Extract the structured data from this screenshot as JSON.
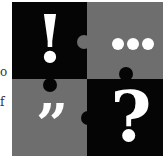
{
  "edge_text": {
    "line1": "o",
    "line2": "f"
  },
  "puzzle": {
    "colors": {
      "dark": "#050505",
      "gray": "#6e6e6e",
      "glyph": "#ffffff"
    },
    "pieces": [
      {
        "position": "top-left",
        "color": "dark",
        "symbol": "!",
        "name": "exclamation"
      },
      {
        "position": "top-right",
        "color": "gray",
        "symbol": "•••",
        "name": "ellipsis"
      },
      {
        "position": "bottom-left",
        "color": "gray",
        "symbol": "”",
        "name": "quotation"
      },
      {
        "position": "bottom-right",
        "color": "dark",
        "symbol": "?",
        "name": "question"
      }
    ]
  }
}
